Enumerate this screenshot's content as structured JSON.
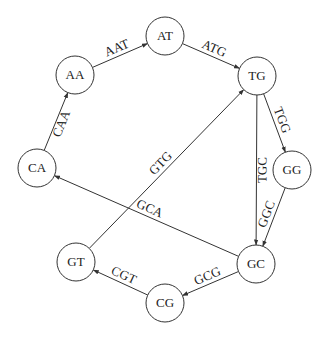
{
  "diagram": {
    "type": "de Bruijn graph",
    "nodes": [
      {
        "id": "AT",
        "label": "AT",
        "x": 165,
        "y": 36
      },
      {
        "id": "AA",
        "label": "AA",
        "x": 75,
        "y": 75
      },
      {
        "id": "TG",
        "label": "TG",
        "x": 257,
        "y": 76
      },
      {
        "id": "CA",
        "label": "CA",
        "x": 37,
        "y": 168
      },
      {
        "id": "GG",
        "label": "GG",
        "x": 292,
        "y": 170
      },
      {
        "id": "GT",
        "label": "GT",
        "x": 76,
        "y": 262
      },
      {
        "id": "GC",
        "label": "GC",
        "x": 256,
        "y": 264
      },
      {
        "id": "CG",
        "label": "CG",
        "x": 165,
        "y": 303
      }
    ],
    "edges": [
      {
        "from": "CA",
        "to": "AA",
        "label": "CAA"
      },
      {
        "from": "AA",
        "to": "AT",
        "label": "AAT"
      },
      {
        "from": "AT",
        "to": "TG",
        "label": "ATG"
      },
      {
        "from": "TG",
        "to": "GG",
        "label": "TGG"
      },
      {
        "from": "TG",
        "to": "GC",
        "label": "TGC"
      },
      {
        "from": "GG",
        "to": "GC",
        "label": "GGC"
      },
      {
        "from": "GC",
        "to": "CA",
        "label": "GCA"
      },
      {
        "from": "GC",
        "to": "CG",
        "label": "GCG"
      },
      {
        "from": "CG",
        "to": "GT",
        "label": "CGT"
      },
      {
        "from": "GT",
        "to": "TG",
        "label": "GTG"
      }
    ]
  }
}
